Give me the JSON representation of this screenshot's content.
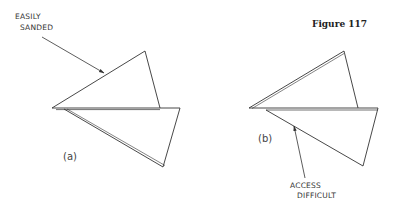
{
  "figure": {
    "title": "Figure 117",
    "panels": [
      {
        "label": "(a)",
        "callout": [
          "EASILY",
          "SANDED"
        ]
      },
      {
        "label": "(b)",
        "callout": [
          "ACCESS",
          "DIFFICULT"
        ]
      }
    ],
    "colors": {
      "line": "#333333",
      "background": "#ffffff"
    }
  }
}
